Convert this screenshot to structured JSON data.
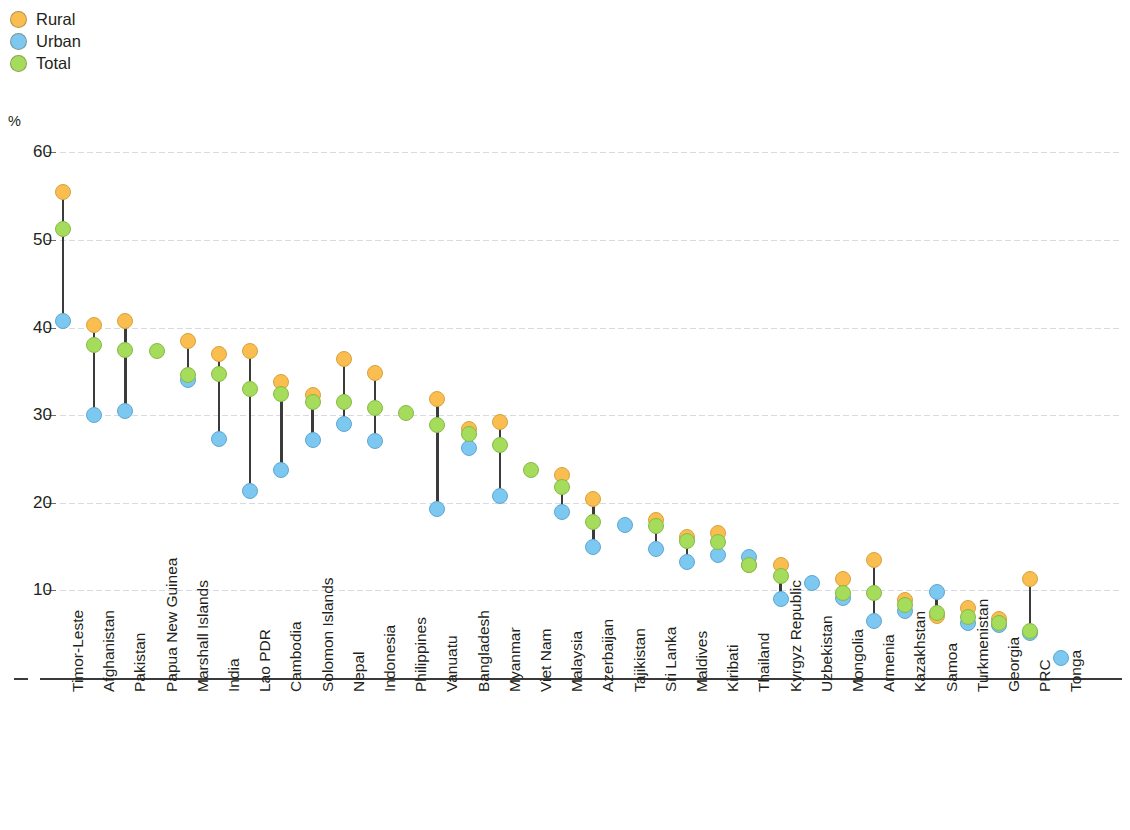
{
  "legend": {
    "position": "top-left",
    "items": [
      {
        "label": "Rural",
        "color": "#F9BE4F",
        "key": "rural"
      },
      {
        "label": "Urban",
        "color": "#7CC8F0",
        "key": "urban"
      },
      {
        "label": "Total",
        "color": "#A5DC5C",
        "key": "total"
      }
    ]
  },
  "axis": {
    "unit_label": "%",
    "yticks": [
      "60",
      "50",
      "40",
      "30",
      "20",
      "10",
      "–"
    ]
  },
  "chart_data": {
    "type": "scatter",
    "title": "",
    "subtitle": "",
    "xlabel": "",
    "ylabel": "%",
    "ylim": [
      0,
      60
    ],
    "yticks": [
      0,
      10,
      20,
      30,
      40,
      50,
      60
    ],
    "grid": true,
    "legend_position": "top-left",
    "note": "Dumbbell/connected-dot chart: each economy shows Rural, Urban and Total values; vertical line connects the extreme Rural and Urban markers.",
    "categories": [
      "Timor-Leste",
      "Afghanistan",
      "Pakistan",
      "Papua New Guinea",
      "Marshall Islands",
      "India",
      "Lao PDR",
      "Cambodia",
      "Solomon Islands",
      "Nepal",
      "Indonesia",
      "Philippines",
      "Vanuatu",
      "Bangladesh",
      "Myanmar",
      "Viet Nam",
      "Malaysia",
      "Azerbaijan",
      "Tajikistan",
      "Sri Lanka",
      "Maldives",
      "Kiribati",
      "Thailand",
      "Kyrgyz Republic",
      "Uzbekistan",
      "Mongolia",
      "Armenia",
      "Kazakhstan",
      "Samoa",
      "Turkmenistan",
      "Georgia",
      "PRC",
      "Tonga"
    ],
    "series": [
      {
        "name": "Rural",
        "color": "#F9BE4F",
        "values": [
          55.5,
          40.3,
          40.7,
          null,
          38.5,
          37.0,
          37.3,
          33.8,
          32.3,
          36.4,
          34.8,
          null,
          31.9,
          28.4,
          29.2,
          null,
          23.2,
          20.4,
          null,
          18.0,
          16.1,
          16.5,
          12.9,
          12.9,
          null,
          11.3,
          13.5,
          8.9,
          7.1,
          8.0,
          6.7,
          11.3,
          null
        ]
      },
      {
        "name": "Urban",
        "color": "#7CC8F0",
        "values": [
          40.8,
          30.0,
          30.5,
          null,
          34.0,
          27.3,
          21.4,
          23.7,
          27.2,
          29.0,
          27.1,
          null,
          19.3,
          26.2,
          20.8,
          null,
          19.0,
          15.0,
          17.5,
          14.7,
          13.2,
          14.0,
          13.8,
          9.0,
          10.8,
          9.1,
          6.5,
          7.6,
          9.8,
          6.3,
          6.0,
          5.1,
          2.3
        ]
      },
      {
        "name": "Total",
        "color": "#A5DC5C",
        "values": [
          51.3,
          38.0,
          37.4,
          37.3,
          34.6,
          34.7,
          33.0,
          32.4,
          31.5,
          31.5,
          30.8,
          30.3,
          28.9,
          27.8,
          26.6,
          23.8,
          21.8,
          17.8,
          null,
          17.3,
          15.6,
          15.5,
          12.9,
          11.7,
          null,
          9.7,
          9.7,
          8.3,
          7.4,
          7.0,
          6.3,
          5.4,
          null
        ]
      }
    ]
  }
}
